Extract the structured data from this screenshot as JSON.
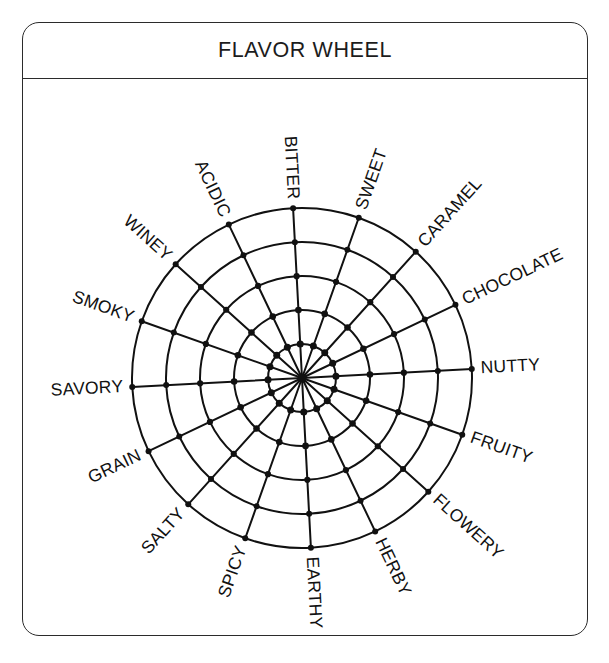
{
  "panel": {
    "title": "FLAVOR WHEEL"
  },
  "chart_data": {
    "type": "radar",
    "title": "FLAVOR WHEEL",
    "subtitle": "",
    "xlabel": "",
    "ylabel": "",
    "grid": true,
    "legend": "none",
    "rings": 5,
    "spokes": 16,
    "rmin": 0,
    "rmax": 5,
    "categories": [
      "BITTER",
      "SWEET",
      "CARAMEL",
      "CHOCOLATE",
      "NUTTY",
      "FRUITY",
      "FLOWERY",
      "HERBY",
      "EARTHY",
      "SPICY",
      "SALTY",
      "GRAIN",
      "SAVORY",
      "SMOKY",
      "WINEY",
      "ACIDIC"
    ],
    "series": [
      {
        "name": "grid",
        "values": [
          5,
          5,
          5,
          5,
          5,
          5,
          5,
          5,
          5,
          5,
          5,
          5,
          5,
          5,
          5,
          5
        ]
      }
    ],
    "tick_values": [
      1,
      2,
      3,
      4,
      5
    ],
    "tick_labels": [
      "",
      "",
      "",
      "",
      ""
    ],
    "annotations": []
  },
  "colors": {
    "stroke": "#111111",
    "panel_border": "#2b2b2b",
    "background": "#ffffff",
    "text": "#1c1c1c"
  },
  "geometry": {
    "center_x": 279,
    "center_y": 299,
    "outer_radius": 170,
    "start_angle_deg": -93
  }
}
